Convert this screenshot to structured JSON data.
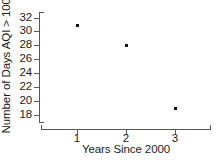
{
  "chart_data": {
    "type": "scatter",
    "title": "",
    "xlabel": "Years Since 2000",
    "ylabel": "Number of Days AQI > 100",
    "x": [
      1,
      2,
      3
    ],
    "values": [
      31,
      28,
      19
    ],
    "points": [
      {
        "x": 1,
        "y": 31
      },
      {
        "x": 2,
        "y": 28
      },
      {
        "x": 3,
        "y": 19
      }
    ],
    "xlim": [
      0.28,
      3.72
    ],
    "ylim": [
      17.0,
      32.8
    ],
    "xticks": [
      1,
      2,
      3
    ],
    "xtick_labels": [
      "1",
      "2",
      "3"
    ],
    "yticks": [
      18,
      20,
      22,
      24,
      26,
      28,
      30,
      32
    ],
    "ytick_labels": [
      "32",
      "30",
      "28",
      "26",
      "24",
      "22",
      "20",
      "18"
    ],
    "grid": false,
    "legend": null,
    "marker_color": "#111111",
    "axis_color": "#585858",
    "background": "#ffffff"
  }
}
